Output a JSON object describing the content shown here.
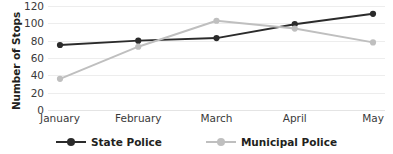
{
  "chart_data": {
    "type": "line",
    "title": "",
    "xlabel": "",
    "ylabel": "Number of Stops",
    "categories": [
      "January",
      "February",
      "March",
      "April",
      "May"
    ],
    "ylim": [
      0,
      120
    ],
    "yticks": [
      0,
      20,
      40,
      60,
      80,
      100,
      120
    ],
    "grid": true,
    "legend_position": "bottom",
    "series": [
      {
        "name": "State Police",
        "color": "#2b2b2b",
        "marker": "circle",
        "values": [
          75,
          80,
          83,
          99,
          111
        ]
      },
      {
        "name": "Municipal Police",
        "color": "#bfbfbf",
        "marker": "circle",
        "values": [
          36,
          73,
          103,
          94,
          78
        ]
      }
    ]
  },
  "axis": {
    "y_title": "Number of Stops",
    "y_tick_labels": [
      "120",
      "100",
      "80",
      "60",
      "40",
      "20",
      "0"
    ],
    "x_tick_labels": [
      "January",
      "February",
      "March",
      "April",
      "May"
    ]
  },
  "legend": {
    "items": [
      {
        "label": "State Police",
        "color": "#2b2b2b"
      },
      {
        "label": "Municipal Police",
        "color": "#bfbfbf"
      }
    ]
  }
}
